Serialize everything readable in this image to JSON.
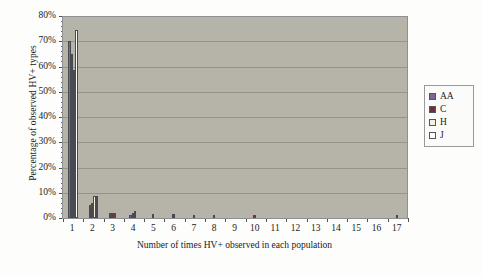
{
  "chart_data": {
    "type": "bar",
    "title": "",
    "subtitle": "",
    "xlabel": "Number of times HV+ observed in each population",
    "ylabel": "Percentage of observed HV+ types",
    "categories": [
      "1",
      "2",
      "3",
      "4",
      "5",
      "6",
      "7",
      "8",
      "9",
      "10",
      "11",
      "12",
      "13",
      "14",
      "15",
      "16",
      "17"
    ],
    "ylim": [
      0,
      80
    ],
    "ytick_labels": [
      "0%",
      "10%",
      "20%",
      "30%",
      "40%",
      "50%",
      "60%",
      "70%",
      "80%"
    ],
    "ytick_values": [
      0,
      10,
      20,
      30,
      40,
      50,
      60,
      70,
      80
    ],
    "ytick_suffix": "%",
    "grid": "horizontal",
    "legend_position": "right",
    "series": [
      {
        "name": "AA",
        "color": "#7a6a93",
        "values": [
          70.0,
          5.3,
          1.8,
          1.0,
          0.0,
          0.0,
          0.0,
          0.0,
          0.0,
          0.0,
          0.0,
          0.0,
          0.0,
          0.0,
          0.0,
          0.0,
          0.0
        ]
      },
      {
        "name": "C",
        "color": "#6e2f3a",
        "values": [
          65.0,
          5.8,
          2.0,
          1.9,
          1.6,
          1.6,
          1.0,
          1.0,
          0.0,
          1.0,
          0.0,
          0.0,
          0.0,
          0.0,
          0.0,
          0.0,
          1.0
        ]
      },
      {
        "name": "H",
        "color": "#f5f0dc",
        "values": [
          58.8,
          8.6,
          2.0,
          2.9,
          0.0,
          0.0,
          0.0,
          0.0,
          0.0,
          0.0,
          0.0,
          0.0,
          0.0,
          0.0,
          0.0,
          0.0,
          0.0
        ]
      },
      {
        "name": "J",
        "color": "#fdfdfb",
        "values": [
          74.5,
          8.6,
          0.0,
          0.0,
          0.0,
          0.0,
          0.0,
          0.0,
          0.0,
          0.0,
          0.0,
          0.0,
          0.0,
          0.0,
          0.0,
          0.0,
          0.0
        ]
      }
    ],
    "plot_background": "#b6b3a8",
    "gridline_color": "#8d8e88",
    "axis_color": "#6b6f73"
  },
  "legend": {
    "items": [
      {
        "label": "AA"
      },
      {
        "label": "C"
      },
      {
        "label": "H"
      },
      {
        "label": "J"
      }
    ]
  }
}
